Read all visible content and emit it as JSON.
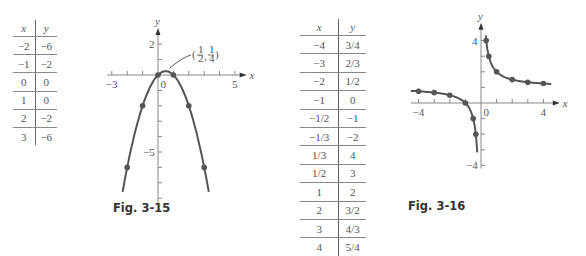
{
  "figures": [
    {
      "caption": "Fig. 3-15",
      "table": {
        "headers": [
          "x",
          "y"
        ],
        "rows": [
          [
            "−2",
            "−6"
          ],
          [
            "−1",
            "−2"
          ],
          [
            "0",
            "0"
          ],
          [
            "1",
            "0"
          ],
          [
            "2",
            "−2"
          ],
          [
            "3",
            "−6"
          ]
        ]
      },
      "annotation": "(1/2, 1/4)"
    },
    {
      "caption": "Fig. 3-16",
      "table": {
        "headers": [
          "x",
          "y"
        ],
        "rows": [
          [
            "−4",
            "3/4"
          ],
          [
            "−3",
            "2/3"
          ],
          [
            "−2",
            "1/2"
          ],
          [
            "−1",
            "0"
          ],
          [
            "−1/2",
            "−1"
          ],
          [
            "−1/3",
            "−2"
          ],
          [
            "1/3",
            "4"
          ],
          [
            "1/2",
            "3"
          ],
          [
            "1",
            "2"
          ],
          [
            "2",
            "3/2"
          ],
          [
            "3",
            "4/3"
          ],
          [
            "4",
            "5/4"
          ]
        ]
      }
    }
  ],
  "chart_data": [
    {
      "type": "line",
      "title": "Fig. 3-15",
      "function": "y = x - x^2",
      "xlabel": "x",
      "ylabel": "y",
      "x_ticks_labeled": [
        "−3",
        "0",
        "5"
      ],
      "y_ticks_labeled": [
        "2",
        "−5"
      ],
      "xlim": [
        -3,
        5
      ],
      "ylim": [
        -7.5,
        2.5
      ],
      "grid": false,
      "points": [
        [
          -2,
          -6
        ],
        [
          -1,
          -2
        ],
        [
          0,
          0
        ],
        [
          0.5,
          0.25
        ],
        [
          1,
          0
        ],
        [
          2,
          -2
        ],
        [
          3,
          -6
        ]
      ],
      "annotations": [
        {
          "text": "(1/2, 1/4)",
          "at": [
            0.5,
            0.25
          ]
        }
      ]
    },
    {
      "type": "line",
      "title": "Fig. 3-16",
      "function": "y = (x+1)/x",
      "xlabel": "x",
      "ylabel": "y",
      "x_ticks_labeled": [
        "−4",
        "0",
        "4"
      ],
      "y_ticks_labeled": [
        "4",
        "−4"
      ],
      "xlim": [
        -4.5,
        4.5
      ],
      "ylim": [
        -4,
        4.5
      ],
      "grid": false,
      "points": [
        [
          -4,
          0.75
        ],
        [
          -3,
          0.667
        ],
        [
          -2,
          0.5
        ],
        [
          -1,
          0
        ],
        [
          -0.5,
          -1
        ],
        [
          -0.333,
          -2
        ],
        [
          0.333,
          4
        ],
        [
          0.5,
          3
        ],
        [
          1,
          2
        ],
        [
          2,
          1.5
        ],
        [
          3,
          1.333
        ],
        [
          4,
          1.25
        ]
      ]
    }
  ]
}
